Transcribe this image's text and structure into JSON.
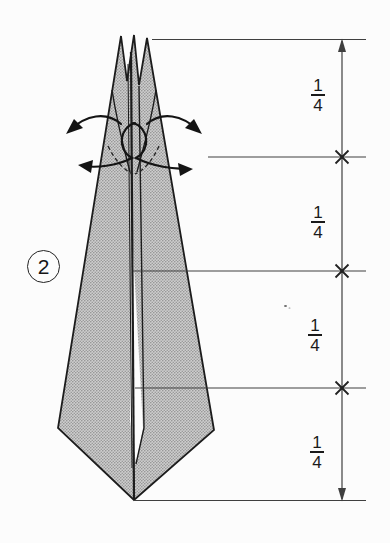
{
  "step": {
    "number": "2"
  },
  "dimension_panel": {
    "labels": [
      {
        "numerator": "1",
        "denominator": "4"
      },
      {
        "numerator": "1",
        "denominator": "4"
      },
      {
        "numerator": "1",
        "denominator": "4"
      },
      {
        "numerator": "1",
        "denominator": "4"
      }
    ]
  },
  "colors": {
    "ink": "#1c1c1c",
    "reference_line": "#3f3f3f",
    "paper": "#fcfcfc",
    "shape_halftone_light": "#cecece",
    "shape_halftone_dot": "#8d8d8d"
  }
}
